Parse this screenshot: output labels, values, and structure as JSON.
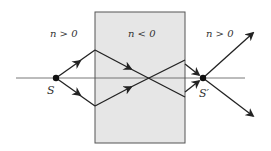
{
  "diagram": {
    "left_region_label": "n > 0",
    "slab_label": "n < 0",
    "right_region_label": "n > 0",
    "source_label": "S",
    "image_label": "S′",
    "colors": {
      "slab_fill": "#e6e6e6",
      "slab_border": "#555555",
      "ray": "#222222",
      "axis": "#555555"
    }
  }
}
